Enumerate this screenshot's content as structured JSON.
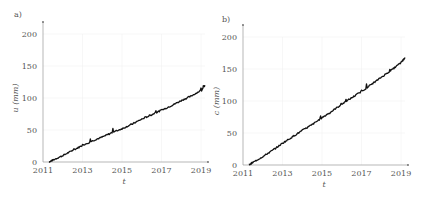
{
  "chart_data": [
    {
      "type": "line",
      "panel_label": "a)",
      "xlabel": "t",
      "ylabel": "u (mm)",
      "xlim": [
        2011,
        2019.2
      ],
      "ylim": [
        0,
        200
      ],
      "xticks": [
        "2011",
        "2013",
        "2015",
        "2017",
        "2019"
      ],
      "yticks": [
        "0",
        "50",
        "100",
        "150",
        "200"
      ],
      "grid": true,
      "series": [
        {
          "name": "u",
          "x": [
            2011.3,
            2011.5,
            2012,
            2012.5,
            2013,
            2013.5,
            2014,
            2014.5,
            2015,
            2015.5,
            2016,
            2016.5,
            2017,
            2017.5,
            2018,
            2018.5,
            2019,
            2019.2
          ],
          "values": [
            0,
            3,
            10,
            18,
            26,
            33,
            39,
            46,
            52,
            59,
            67,
            74,
            81,
            88,
            96,
            103,
            112,
            120
          ]
        }
      ]
    },
    {
      "type": "line",
      "panel_label": "b)",
      "xlabel": "t",
      "ylabel": "c (mm)",
      "xlim": [
        2011,
        2019.2
      ],
      "ylim": [
        0,
        200
      ],
      "xticks": [
        "2011",
        "2013",
        "2015",
        "2017",
        "2019"
      ],
      "yticks": [
        "0",
        "50",
        "100",
        "150",
        "200"
      ],
      "grid": true,
      "series": [
        {
          "name": "c",
          "x": [
            2011.3,
            2011.5,
            2012,
            2012.5,
            2013,
            2013.5,
            2014,
            2014.5,
            2015,
            2015.5,
            2016,
            2016.5,
            2017,
            2017.5,
            2018,
            2018.5,
            2019,
            2019.2
          ],
          "values": [
            0,
            4,
            13,
            23,
            34,
            44,
            54,
            63,
            74,
            84,
            95,
            105,
            115,
            126,
            137,
            148,
            160,
            168
          ]
        }
      ]
    }
  ]
}
